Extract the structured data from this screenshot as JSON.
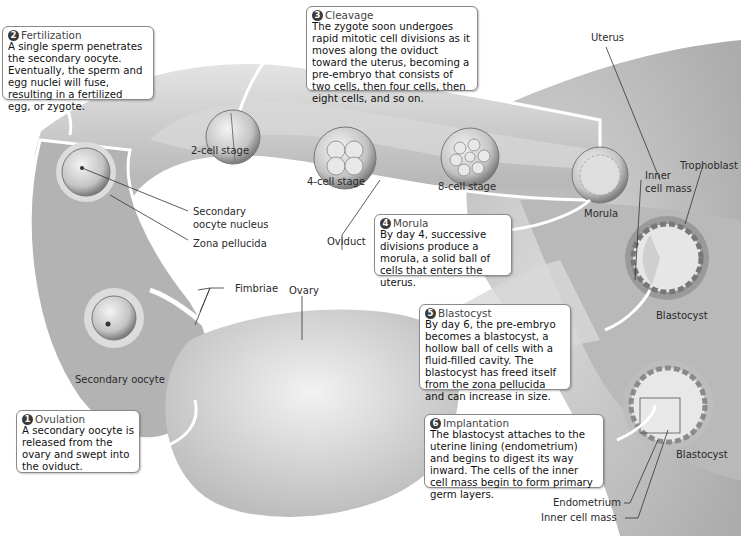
{
  "callouts": [
    {
      "num": "1",
      "heading": "Ovulation",
      "text": "A secondary oocyte is released from the ovary and swept into the oviduct."
    },
    {
      "num": "2",
      "heading": "Fertilization",
      "text": "A single sperm penetrates the secondary oocyte. Eventually, the sperm and egg nuclei will fuse, resulting in a fertilized egg, or zygote."
    },
    {
      "num": "3",
      "heading": "Cleavage",
      "text": "The zygote soon undergoes rapid mitotic cell divisions as it moves along the oviduct toward the uterus, becoming a pre-embryo that consists of two cells, then four cells, then eight cells, and so on."
    },
    {
      "num": "4",
      "heading": "Morula",
      "text": "By day 4, successive divisions produce a morula, a solid ball of cells that enters the uterus."
    },
    {
      "num": "5",
      "heading": "Blastocyst",
      "text": "By day 6, the pre-embryo becomes a blastocyst, a hollow ball of cells with a fluid-filled cavity. The blastocyst has freed itself from the zona pellucida and can increase in size."
    },
    {
      "num": "6",
      "heading": "Implantation",
      "text": "The blastocyst attaches to the uterine lining (endometrium) and begins to digest its way inward. The cells of the inner cell mass begin to form primary germ layers."
    }
  ],
  "labels": {
    "uterus": "Uterus",
    "two_cell": "2-cell stage",
    "four_cell": "4-cell stage",
    "eight_cell": "8-cell stage",
    "morula": "Morula",
    "trophoblast": "Trophoblast",
    "inner_cell_mass_1": "Inner",
    "inner_cell_mass_2": "cell mass",
    "blastocyst_1": "Blastocyst",
    "blastocyst_2": "Blastocyst",
    "secondary_oocyte_nucleus_1": "Secondary",
    "secondary_oocyte_nucleus_2": "oocyte nucleus",
    "zona_pellucida": "Zona pellucida",
    "oviduct": "Oviduct",
    "fimbriae": "Fimbriae",
    "ovary": "Ovary",
    "secondary_oocyte": "Secondary oocyte",
    "endometrium": "Endometrium",
    "inner_cell_mass": "Inner cell mass"
  },
  "colors": {
    "tissue": "#c9c9c9",
    "tissue_dark": "#9a9a9a",
    "badge": "#3a3a3a"
  }
}
